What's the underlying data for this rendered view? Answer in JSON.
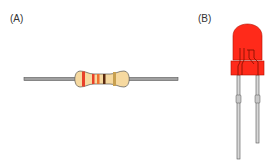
{
  "figure": {
    "panel_a": {
      "label": "(A)",
      "component": "resistor",
      "band_colors": [
        "#e8402a",
        "#e8402a",
        "#f07030",
        "#5a2a10",
        "#c8a050"
      ],
      "body_color": "#f6d9a0",
      "lead_color": "#9a9a9a"
    },
    "panel_b": {
      "label": "(B)",
      "component": "led",
      "body_color": "#ff2a1a",
      "lead_color": "#d0d0d0"
    }
  }
}
